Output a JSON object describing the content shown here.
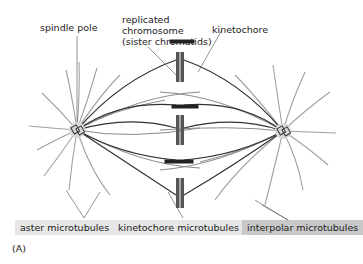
{
  "figure": {
    "panel_label": "(A)"
  },
  "labels": {
    "spindle_pole": "spindle pole",
    "replicated_chromosome_line1": "replicated",
    "replicated_chromosome_line2": "chromosome",
    "replicated_chromosome_line3": "(sister chromatids)",
    "kinetochore": "kinetochore",
    "aster_microtubules": "aster microtubules",
    "kinetochore_microtubules": "kinetochore microtubules",
    "interpolar_microtubules": "interpolar microtubules"
  },
  "colors": {
    "aster_line": "#a0a0a0",
    "kinetochore_line": "#3a3a3a",
    "interpolar_line": "#707070",
    "pole_glow": "#d8d8d8",
    "chromatid": "#555555",
    "label_box_light": "#e6e6e6",
    "label_box_dark": "#c8c8c8"
  }
}
